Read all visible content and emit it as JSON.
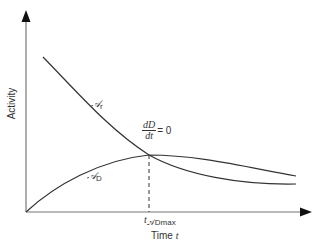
{
  "diagram": {
    "type": "kinetic activity curves",
    "axes": {
      "y_label": "Activity",
      "x_label_prefix": "Time ",
      "x_label_var": "t"
    },
    "curves": [
      {
        "name": "parent",
        "symbol": "𝒜",
        "subscript": "r",
        "shape": "decreasing exponential"
      },
      {
        "name": "daughter",
        "symbol": "𝒜",
        "subscript": "D",
        "shape": "rising to maximum then decaying"
      }
    ],
    "annotation": {
      "numerator": "dD",
      "denominator": "dt",
      "equals": "= 0"
    },
    "tick": {
      "var": "t",
      "subscript": "𝒜Dmax"
    },
    "colors": {
      "axis": "#777777",
      "curve": "#333333",
      "background": "#ffffff"
    }
  }
}
